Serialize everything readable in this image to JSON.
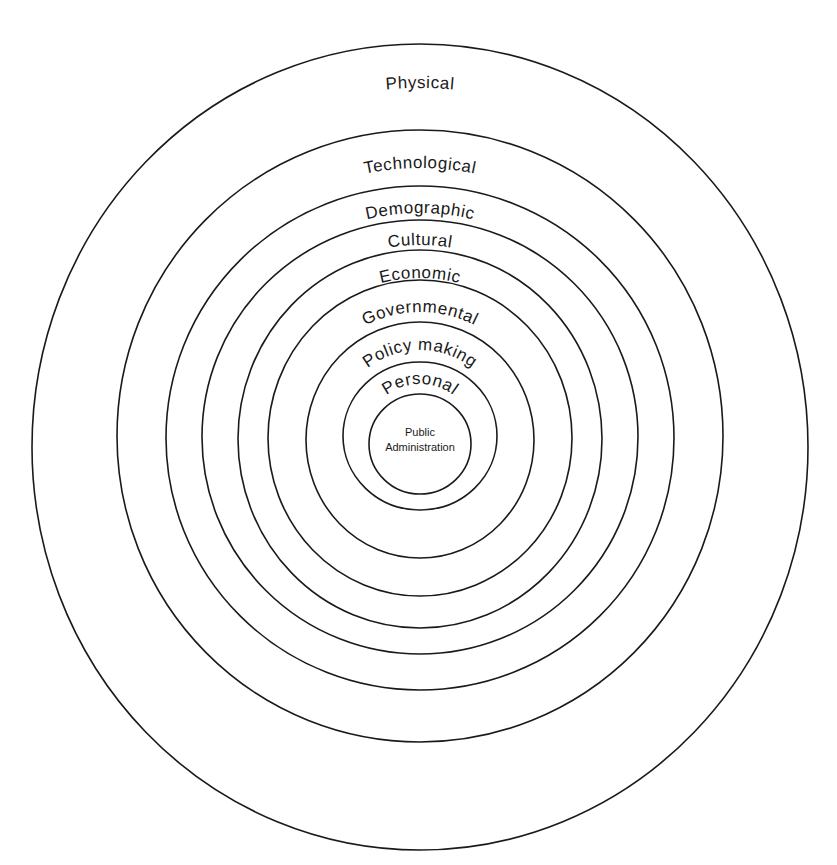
{
  "diagram": {
    "type": "concentric-layers",
    "center_label": {
      "line1": "Public",
      "line2": "Administration"
    },
    "layers": [
      {
        "label": "Physical"
      },
      {
        "label": "Technological"
      },
      {
        "label": "Demographic"
      },
      {
        "label": "Cultural"
      },
      {
        "label": "Economic"
      },
      {
        "label": "Governmental"
      },
      {
        "label": "Policy making"
      },
      {
        "label": "Personal"
      }
    ]
  }
}
